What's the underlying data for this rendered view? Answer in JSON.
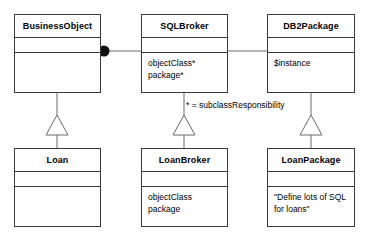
{
  "diagram": {
    "type": "uml-class-diagram",
    "background_color": "#ffffff",
    "line_color": "#3a3a3a",
    "text_color": "#000000",
    "note": "* = subclassResponsibility",
    "classes": [
      {
        "id": "business-object",
        "name": "BusinessObject",
        "attributes": []
      },
      {
        "id": "sql-broker",
        "name": "SQLBroker",
        "attributes": [
          "objectClass*",
          "package*"
        ]
      },
      {
        "id": "db2-package",
        "name": "DB2Package",
        "attributes": [
          "$instance"
        ]
      },
      {
        "id": "loan",
        "name": "Loan",
        "attributes": []
      },
      {
        "id": "loan-broker",
        "name": "LoanBroker",
        "attributes": [
          "objectClass",
          "package"
        ]
      },
      {
        "id": "loan-package",
        "name": "LoanPackage",
        "attributes": [
          "\"Define lots of SQL",
          "for loans\""
        ]
      }
    ],
    "relationships": [
      {
        "kind": "association-with-filled-ball",
        "from": "business-object",
        "to": "sql-broker"
      },
      {
        "kind": "association",
        "from": "sql-broker",
        "to": "db2-package"
      },
      {
        "kind": "generalization",
        "from": "loan",
        "to": "business-object"
      },
      {
        "kind": "generalization",
        "from": "loan-broker",
        "to": "sql-broker"
      },
      {
        "kind": "generalization",
        "from": "loan-package",
        "to": "db2-package"
      }
    ]
  }
}
